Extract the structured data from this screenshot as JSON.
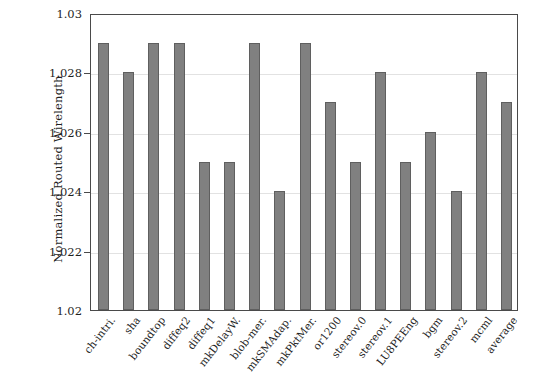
{
  "chart_data": {
    "type": "bar",
    "title": "",
    "subtitle": "",
    "xlabel": "",
    "ylabel": "Normalized Routed Wirelength",
    "ylim": [
      1.02,
      1.03
    ],
    "yticks": [
      "1.02",
      "1.022",
      "1.024",
      "1.026",
      "1.028",
      "1.03"
    ],
    "ytick_values": [
      1.02,
      1.022,
      1.024,
      1.026,
      1.028,
      1.03
    ],
    "grid": "horizontal",
    "legend": null,
    "legend_position": "none",
    "bar_color": "#808080",
    "bar_edge_color": "#5f5f5f",
    "axis_color": "#4a4a4a",
    "grid_color": "#e2e2e2",
    "categories": [
      "ch-intri.",
      "sha",
      "boundtop",
      "diffeq2",
      "diffeq1",
      "mkDelayW.",
      "blob-mer.",
      "mkSMAdap.",
      "mkPktMer.",
      "or1200",
      "stereov.0",
      "stereov.1",
      "LU8PEEng",
      "bgm",
      "stereov.2",
      "mcml",
      "average"
    ],
    "values": [
      1.029,
      1.028,
      1.029,
      1.029,
      1.025,
      1.025,
      1.029,
      1.024,
      1.029,
      1.027,
      1.025,
      1.028,
      1.025,
      1.026,
      1.024,
      1.028,
      1.027
    ]
  }
}
